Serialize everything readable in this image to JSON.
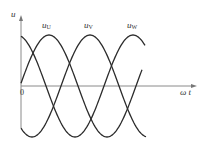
{
  "figure": {
    "axes": {
      "y_label": "u",
      "x_label": "ω t",
      "origin_label": "0"
    },
    "series_labels": [
      {
        "base": "u",
        "sub": "U"
      },
      {
        "base": "u",
        "sub": "V"
      },
      {
        "base": "u",
        "sub": "W"
      }
    ]
  },
  "chart_data": {
    "type": "line",
    "title": "",
    "xlabel": "ωt",
    "ylabel": "u",
    "grid": false,
    "legend": "inline labels above each curve's peak",
    "series": [
      {
        "name": "uU",
        "phase_deg": 0,
        "amplitude": 1
      },
      {
        "name": "uV",
        "phase_deg": -120,
        "amplitude": 1
      },
      {
        "name": "uW",
        "phase_deg": 120,
        "amplitude": 1
      }
    ],
    "x_range_deg": [
      0,
      400
    ],
    "ylim": [
      -1,
      1
    ]
  },
  "geometry": {
    "origin": [
      21,
      86
    ],
    "x_axis_end": 197,
    "y_axis_top": 15,
    "y_axis_bottom": 128,
    "amplitude_px": 51,
    "period_px": 116,
    "x_start": 21,
    "curves": [
      {
        "name": "uU",
        "peak_x": 49,
        "x_end": 142
      },
      {
        "name": "uV",
        "peak_x": 90,
        "x_end": 146
      },
      {
        "name": "uW",
        "peak_x": 133,
        "x_end": 145
      }
    ],
    "colors": {
      "curve": "#2b2b2b",
      "axis": "#8a8a8a",
      "text": "#333333"
    }
  }
}
